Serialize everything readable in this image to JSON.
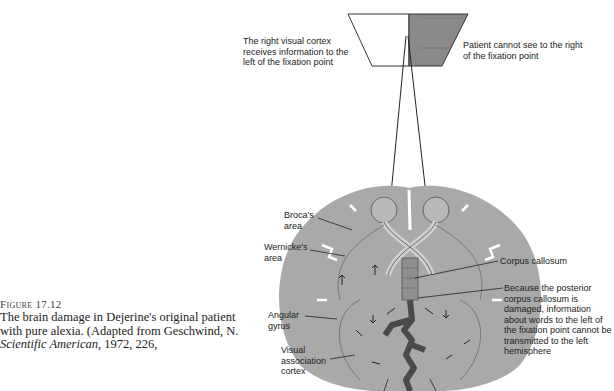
{
  "caption": {
    "figure_label": "Figure 17.12",
    "text_1": "The brain damage in Dejerine's original patient with pure alexia. (Adapted from Geschwind, N. ",
    "text_journal": "Scientific American",
    "text_2": ", 1972, 226,"
  },
  "visual_field": {
    "left_label": "The right visual cortex receives information to the left of the fixation point",
    "right_label": "Patient cannot see to the right of the fixation point",
    "blind_fill": "#8a8a8a"
  },
  "brain_labels": {
    "broca": "Broca's area",
    "wernicke": "Wernicke's area",
    "angular": "Angular gyrus",
    "visual_assoc": "Visual association cortex",
    "corpus": "Corpus callosum",
    "damage_note": "Because the posterior corpus callosum is damaged, information about words to the left of the fixation point cannot be transmitted to the left hemisphere"
  },
  "colors": {
    "brain": "#a9a9a9",
    "lesion": "#4a4a4a",
    "line": "#222222"
  }
}
